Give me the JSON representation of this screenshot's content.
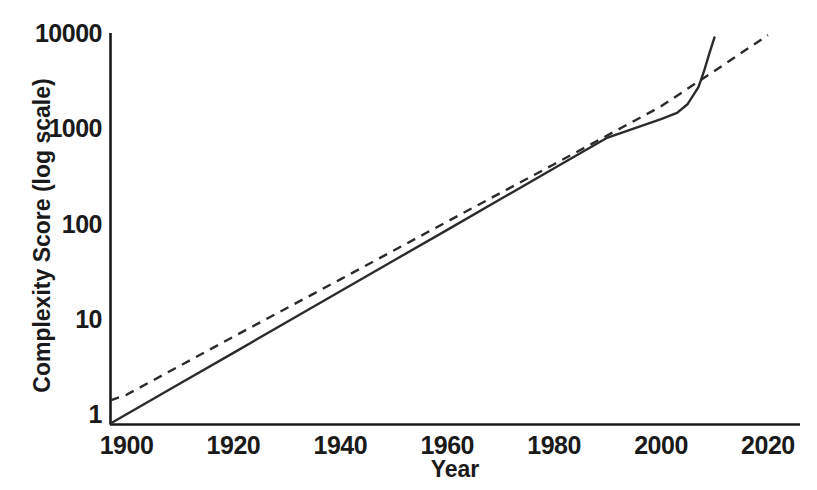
{
  "chart_data": {
    "type": "line",
    "title": "",
    "xlabel": "Year",
    "ylabel": "Complexity Score (log scale)",
    "yscale": "log",
    "xscale": "linear",
    "xlim": [
      1897,
      2026
    ],
    "ylim": [
      0.78,
      10000
    ],
    "grid": false,
    "legend": null,
    "xticks": [
      1900,
      1920,
      1940,
      1960,
      1980,
      2000,
      2020
    ],
    "xtick_labels": [
      "1900",
      "1920",
      "1940",
      "1960",
      "1980",
      "2000",
      "2020"
    ],
    "yticks": [
      1,
      10,
      100,
      1000,
      10000
    ],
    "ytick_labels": [
      "1",
      "10",
      "100",
      "1000",
      "10000"
    ],
    "colors": {
      "axis": "#1a1a1a",
      "solid_series": "#2b2b2b",
      "dashed_series": "#2b2b2b",
      "background": "#ffffff"
    },
    "series": [
      {
        "name": "solid-series",
        "style": "solid",
        "color": "#2b2b2b",
        "linewidth": 2.4,
        "x": [
          1897,
          1900,
          1910,
          1920,
          1930,
          1940,
          1950,
          1960,
          1970,
          1980,
          1990,
          1995,
          2000,
          2003,
          2005,
          2007,
          2008,
          2009,
          2010
        ],
        "y": [
          0.8,
          1.0,
          2.1,
          4.4,
          9.3,
          19.5,
          41,
          86,
          181,
          381,
          800,
          1000,
          1250,
          1450,
          1800,
          2700,
          3900,
          6000,
          9000
        ]
      },
      {
        "name": "dashed-series",
        "style": "dashed",
        "color": "#2b2b2b",
        "linewidth": 2.4,
        "dash_pattern": [
          9,
          7
        ],
        "x": [
          1897,
          1900,
          1920,
          1940,
          1960,
          1980,
          2000,
          2010,
          2020
        ],
        "y": [
          1.4,
          1.6,
          6.5,
          26,
          105,
          420,
          1700,
          4000,
          9500
        ]
      }
    ],
    "annotations": [
      {
        "text": "solid and dashed series cross near 2008",
        "approx_x": 2008,
        "approx_y": 3200
      }
    ]
  },
  "axes": {
    "y_title": "Complexity Score (log scale)",
    "x_title": "Year"
  }
}
